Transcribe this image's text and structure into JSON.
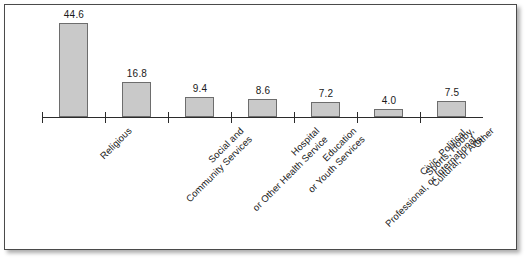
{
  "chart_data": {
    "type": "bar",
    "title": "",
    "subtitle": "",
    "xlabel": "",
    "ylabel": "",
    "ylim": [
      0,
      44.6
    ],
    "grid": false,
    "legend": null,
    "axis": {
      "baseline_visible": true,
      "value_axis_visible": false,
      "tick_count": 7
    },
    "categories": [
      "Religious",
      "Social and Community Services",
      "Hospital or Other Health Service",
      "Education or Youth Services",
      "Civic, Political, Professional, or International",
      "Sports, Hobby, Cultural, or Arts",
      "Other"
    ],
    "category_lines": [
      [
        "Religious",
        ""
      ],
      [
        "Social and",
        "Community Services"
      ],
      [
        "Hospital",
        "or Other Health Service"
      ],
      [
        "Education",
        "or Youth Services"
      ],
      [
        "Civic, Political,",
        "Professional, or International"
      ],
      [
        "Sports, Hobby,",
        "Cultural, or Arts"
      ],
      [
        "Other",
        ""
      ]
    ],
    "values": [
      44.6,
      16.8,
      9.4,
      8.6,
      7.2,
      4.0,
      7.5
    ],
    "value_labels": [
      "44.6",
      "16.8",
      "9.4",
      "8.6",
      "7.2",
      "4.0",
      "7.5"
    ],
    "colors": {
      "bar_fill": "#c9c9c9",
      "bar_stroke": "#6d6d6d",
      "axis": "#2b2b2b",
      "text": "#1a1a1a",
      "background": "#ffffff",
      "frame": "#4a4a4a"
    }
  }
}
